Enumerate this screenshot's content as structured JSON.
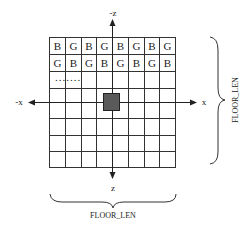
{
  "diagram": {
    "grid": {
      "columns": 8,
      "rows": 8,
      "row1": [
        "B",
        "G",
        "B",
        "G",
        "B",
        "G",
        "B",
        "G"
      ],
      "row2": [
        "G",
        "B",
        "G",
        "B",
        "G",
        "B",
        "G",
        "B"
      ],
      "ellipsis": ".......",
      "origin_marker": "shaded-square"
    },
    "axes": {
      "neg_z": "-z",
      "pos_z": "z",
      "neg_x": "-x",
      "pos_x": "x"
    },
    "dimensions": {
      "right_label": "FLOOR_LEN",
      "bottom_label": "FLOOR_LEN"
    },
    "colors": {
      "line": "#333333",
      "marker_fill": "#5a5a5a",
      "text": "#222222"
    }
  }
}
